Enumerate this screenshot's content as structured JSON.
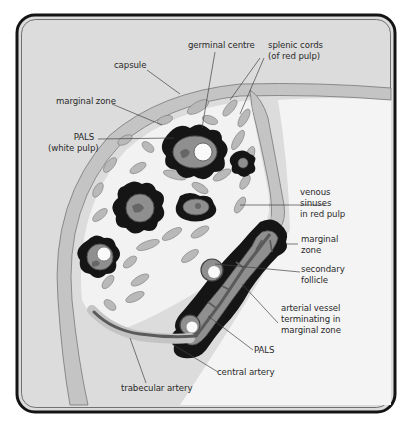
{
  "figure": {
    "colors": {
      "background": "#dcdcdc",
      "frame": "#141414",
      "capsule": "#c4c4c4",
      "red_pulp": "#f2f2f2",
      "cords": "#b9b9b9",
      "marginal_zone": "#151515",
      "pals": "#8f8f8f",
      "germinal_centre": "#fafafa",
      "artery": "#5a5a5a",
      "sinus_space": "#f4f4f4"
    }
  },
  "labels": {
    "germinal_centre": "germinal centre",
    "splenic_cords": "splenic cords\n(of red pulp)",
    "capsule": "capsule",
    "marginal_zone_top": "marginal zone",
    "pals_white_pulp": "PALS\n(white pulp)",
    "venous_sinuses": "venous\nsinuses\nin red pulp",
    "marginal_zone_right": "marginal\nzone",
    "secondary_follicle": "secondary\nfollicle",
    "arterial_vessel": "arterial vessel\nterminating in\nmarginal zone",
    "pals_bottom": "PALS",
    "central_artery": "central artery",
    "trabecular_artery": "trabecular artery"
  }
}
